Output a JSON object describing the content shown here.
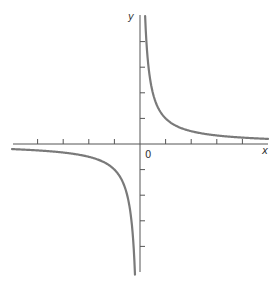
{
  "chart_data": {
    "type": "line",
    "title": "",
    "function": "y = 1/x",
    "xlabel": "x",
    "ylabel": "y",
    "origin_label": "0",
    "xlim": [
      -5,
      5
    ],
    "ylim": [
      -5,
      5
    ],
    "grid": false,
    "x_ticks": [
      -4,
      -3,
      -2,
      -1,
      1,
      2,
      3,
      4
    ],
    "y_ticks": [
      -4,
      -3,
      -2,
      -1,
      1,
      2,
      3,
      4
    ],
    "series": [
      {
        "name": "branch-positive",
        "x": [
          0.2,
          0.25,
          0.33,
          0.5,
          0.75,
          1,
          1.5,
          2,
          3,
          4,
          5
        ],
        "y": [
          5,
          4,
          3,
          2,
          1.33,
          1,
          0.67,
          0.5,
          0.33,
          0.25,
          0.2
        ]
      },
      {
        "name": "branch-negative",
        "x": [
          -5,
          -4,
          -3,
          -2,
          -1.5,
          -1,
          -0.75,
          -0.5,
          -0.33,
          -0.25,
          -0.2
        ],
        "y": [
          -0.2,
          -0.25,
          -0.33,
          -0.5,
          -0.67,
          -1,
          -1.33,
          -2,
          -3,
          -4,
          -5
        ]
      }
    ],
    "colors": {
      "curve": "#7a7a7a",
      "axis": "#555555"
    }
  },
  "layout": {
    "origin_px": [
      140,
      144
    ],
    "unit_px": 25.6
  }
}
